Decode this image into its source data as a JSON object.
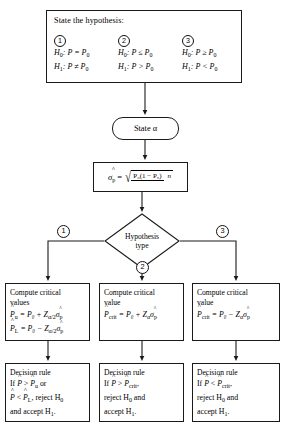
{
  "figure": {
    "type": "flowchart"
  },
  "hypothesis_panel": {
    "title": "State the hypothesis:",
    "columns": [
      {
        "number": "1",
        "null_label": "H",
        "null_sub": "0",
        "null_text": ":  P = P",
        "null_sub2": "0",
        "alt_label": "H",
        "alt_sub": "1",
        "alt_text": ":  P ≠ P",
        "alt_sub2": "0"
      },
      {
        "number": "2",
        "null_label": "H",
        "null_sub": "0",
        "null_text": ":  P ≤ P",
        "null_sub2": "0",
        "alt_label": "H",
        "alt_sub": "1",
        "alt_text": ":  P > P",
        "alt_sub2": "0"
      },
      {
        "number": "3",
        "null_label": "H",
        "null_sub": "0",
        "null_text": ":  P ≥ P",
        "null_sub2": "0",
        "alt_label": "H",
        "alt_sub": "1",
        "alt_text": ":  P < P",
        "alt_sub2": "0"
      }
    ]
  },
  "state_alpha": {
    "label": "State α"
  },
  "sigma_formula": {
    "lhs_symbol": "σ",
    "lhs_sub": "p",
    "equals": "=",
    "numerator": "P₀(1 − P₀)",
    "denominator": "n"
  },
  "decision_node": {
    "line1": "Hypothesis",
    "line2": "type",
    "branch_left": "1",
    "branch_bottom": "2",
    "branch_right": "3"
  },
  "compute_boxes": [
    {
      "title_line1": "Compute critical",
      "title_line2": "values",
      "eq1": {
        "lhs": "P",
        "lhs_sub": "u",
        "rhs": "= P₀ + Z",
        "z_sub": "α/2",
        "sigma": "σ",
        "sigma_sub": "p"
      },
      "eq2": {
        "lhs": "P",
        "lhs_sub": "L",
        "rhs": "= P₀ − Z",
        "z_sub": "α/2",
        "sigma": "σ",
        "sigma_sub": "p"
      }
    },
    {
      "title_line1": "Compute critical",
      "title_line2": "value",
      "eq1": {
        "lhs": "P",
        "lhs_sub": "crit",
        "rhs": "= P₀ + Z",
        "z_sub": "α",
        "sigma": "σ",
        "sigma_sub": "p"
      }
    },
    {
      "title_line1": "Compute critical",
      "title_line2": "value",
      "eq1": {
        "lhs": "P",
        "lhs_sub": "crit",
        "rhs": "= P₀ − Z",
        "z_sub": "α",
        "sigma": "σ",
        "sigma_sub": "p"
      }
    }
  ],
  "decision_boxes": [
    {
      "title": "Decision rule",
      "line1_pre": "If ",
      "line1_a": "P",
      "line1_mid": " > ",
      "line1_b": "P",
      "line1_b_sub": "u",
      "line1_post": " or",
      "line2_a": "P",
      "line2_mid": " < ",
      "line2_b": "P",
      "line2_b_sub": "L",
      "line2_post": ", reject H",
      "line2_sub": "0",
      "line3": "and accept H",
      "line3_sub": "1",
      "line3_end": "."
    },
    {
      "title": "Decision rule",
      "line1_pre": "If ",
      "line1_a": "P",
      "line1_mid": " > ",
      "line1_b": "P",
      "line1_b_sub": "crit",
      "line1_post": ",",
      "line2": "reject H",
      "line2_sub": "0",
      "line2_end": " and",
      "line3": "accept H",
      "line3_sub": "1",
      "line3_end": "."
    },
    {
      "title": "Decision rule",
      "line1_pre": "If ",
      "line1_a": "P",
      "line1_mid": " < ",
      "line1_b": "P",
      "line1_b_sub": "crit",
      "line1_post": ",",
      "line2": "reject H",
      "line2_sub": "0",
      "line2_end": " and",
      "line3": "accept H",
      "line3_sub": "1",
      "line3_end": "."
    }
  ],
  "style": {
    "line_color": "#1a1a1a",
    "background": "#ffffff",
    "text_color": "#000000"
  }
}
